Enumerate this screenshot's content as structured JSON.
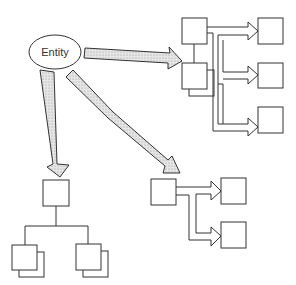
{
  "diagram": {
    "root": {
      "label": "Entity",
      "shape": "ellipse"
    },
    "colors": {
      "stroke": "#333333",
      "fat_arrow_fill": "#d9d9d9",
      "background": "#ffffff"
    },
    "groups": [
      {
        "name": "top-right-group",
        "description": "parent box with stacked child, three branch boxes"
      },
      {
        "name": "middle-group",
        "description": "parent box with two branch boxes"
      },
      {
        "name": "bottom-left-group",
        "description": "parent box with two stacked child boxes"
      }
    ]
  }
}
